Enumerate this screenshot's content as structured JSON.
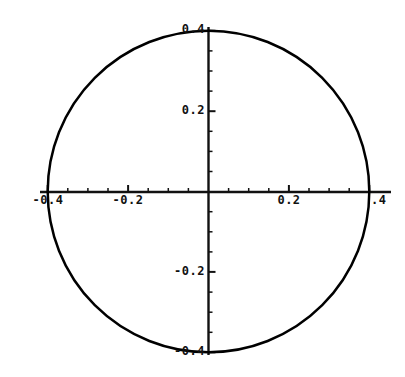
{
  "chart_data": {
    "type": "line",
    "title": "",
    "subtitle": "",
    "xlabel": "",
    "ylabel": "",
    "curve": {
      "name": "circle",
      "shape": "circle",
      "center_x": 0,
      "center_y": 0,
      "radius": 0.4,
      "color": "#000000",
      "line_width": 2.5
    },
    "xlim": [
      -0.44,
      0.46
    ],
    "ylim": [
      -0.43,
      0.43
    ],
    "grid": false,
    "legend": false,
    "legend_position": "none",
    "axes_style": "cartesian-cross-at-origin",
    "x_major_ticks": [
      -0.4,
      -0.2,
      0.2,
      0.4
    ],
    "x_major_tick_labels": [
      "-0.4",
      "-0.2",
      "0.2",
      ".4"
    ],
    "y_major_ticks": [
      -0.4,
      -0.2,
      0.2,
      0.4
    ],
    "y_major_tick_labels": [
      "-0.4",
      "-0.2",
      "0.2",
      "0.4"
    ],
    "x_minor_tick_step": 0.05,
    "y_minor_tick_step": 0.05,
    "tick_color": "#000000",
    "axis_color": "#000000",
    "background_color": "#ffffff"
  },
  "axis_labels": {
    "y_top": "0.4",
    "y_upper": "0.2",
    "y_lower": "-0.2",
    "y_bottom": "-0.4",
    "x_left_outer": "-0.4",
    "x_left_inner": "-0.2",
    "x_right_inner": "0.2",
    "x_right_outer": ".4"
  }
}
